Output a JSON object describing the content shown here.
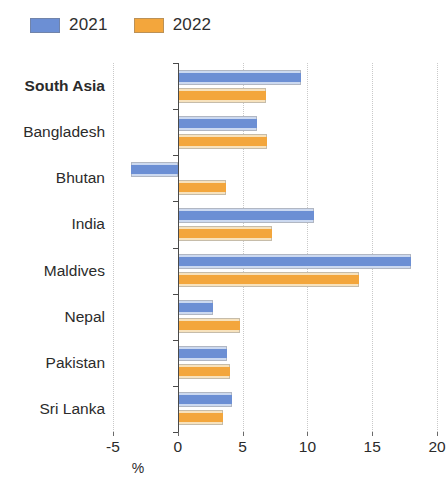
{
  "legend": {
    "position": "top-left",
    "entries": [
      {
        "label": "2021",
        "color": "#6c8fd4",
        "name": "series-2021"
      },
      {
        "label": "2022",
        "color": "#f3a63c",
        "name": "series-2022"
      }
    ]
  },
  "axis": {
    "x_title": "%",
    "ticks": [
      "-5",
      "0",
      "5",
      "10",
      "15",
      "20"
    ]
  },
  "chart_data": {
    "type": "bar",
    "orientation": "horizontal",
    "title": "",
    "subtitle": "",
    "xlabel": "%",
    "ylabel": "",
    "xlim": [
      -5,
      20
    ],
    "xticks": [
      -5,
      0,
      5,
      10,
      15,
      20
    ],
    "grid": "vertical-dotted",
    "legend_position": "top-left",
    "categories": [
      "South Asia",
      "Bangladesh",
      "Bhutan",
      "India",
      "Maldives",
      "Nepal",
      "Pakistan",
      "Sri Lanka"
    ],
    "highlighted_category": "South Asia",
    "series": [
      {
        "name": "2021",
        "color": "#6c8fd4",
        "values": [
          9.5,
          6.1,
          -3.6,
          10.5,
          18.0,
          2.7,
          3.8,
          4.2
        ]
      },
      {
        "name": "2022",
        "color": "#f3a63c",
        "values": [
          6.8,
          6.9,
          3.7,
          7.3,
          14.0,
          4.8,
          4.0,
          3.5
        ]
      }
    ]
  }
}
